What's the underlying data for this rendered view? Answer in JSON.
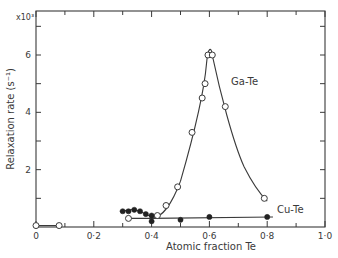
{
  "chart_data": {
    "type": "line",
    "title": "",
    "xlabel": "Atomic fraction Te",
    "ylabel": "Relaxation rate (s⁻¹)",
    "y_multiplier": "x10³",
    "xlim": [
      0,
      1.0
    ],
    "ylim": [
      0,
      7.5
    ],
    "x_ticks": [
      "0",
      "0·2",
      "0·4",
      "0·6",
      "0·8",
      "1·0"
    ],
    "y_ticks": [
      "2",
      "4",
      "6"
    ],
    "grid": false,
    "legend": "inline labels",
    "series": [
      {
        "name": "Ga-Te",
        "marker": "open-circle",
        "points": [
          [
            0.0,
            0.05
          ],
          [
            0.08,
            0.05
          ],
          [
            0.32,
            0.3
          ],
          [
            0.42,
            0.4
          ],
          [
            0.45,
            0.75
          ],
          [
            0.49,
            1.4
          ],
          [
            0.54,
            3.3
          ],
          [
            0.575,
            4.5
          ],
          [
            0.585,
            5.0
          ],
          [
            0.595,
            6.0
          ],
          [
            0.61,
            6.0
          ],
          [
            0.655,
            4.2
          ],
          [
            0.79,
            1.0
          ]
        ]
      },
      {
        "name": "Cu-Te",
        "marker": "filled-circle",
        "points": [
          [
            0.3,
            0.55
          ],
          [
            0.32,
            0.55
          ],
          [
            0.34,
            0.6
          ],
          [
            0.36,
            0.55
          ],
          [
            0.38,
            0.45
          ],
          [
            0.4,
            0.4
          ],
          [
            0.4,
            0.2
          ],
          [
            0.5,
            0.25
          ],
          [
            0.6,
            0.35
          ],
          [
            0.8,
            0.35
          ]
        ]
      }
    ],
    "annotations": [
      "Ga-Te",
      "Cu-Te"
    ]
  }
}
